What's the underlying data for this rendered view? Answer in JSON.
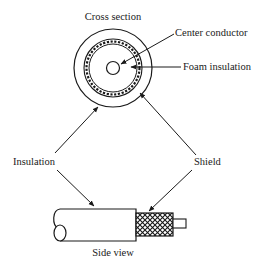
{
  "diagram": {
    "title_cross_section": "Cross section",
    "title_side_view": "Side view",
    "labels": {
      "center_conductor": "Center conductor",
      "foam_insulation": "Foam insulation",
      "insulation": "Insulation",
      "shield": "Shield"
    },
    "colors": {
      "ink": "#1a1a1a",
      "background": "#ffffff"
    }
  }
}
